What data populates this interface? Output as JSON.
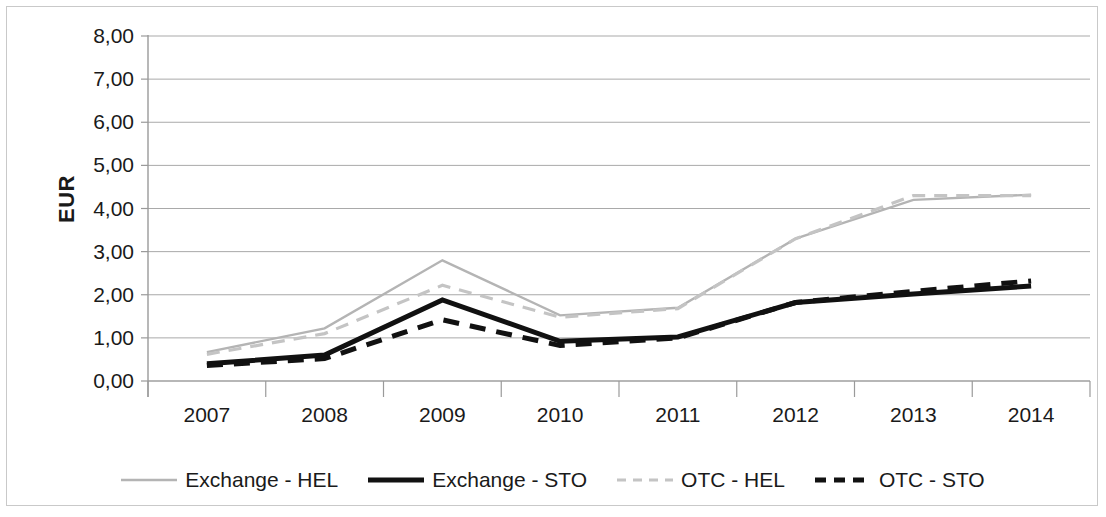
{
  "chart_data": {
    "type": "line",
    "title": "",
    "xlabel": "",
    "ylabel": "EUR",
    "categories": [
      "2007",
      "2008",
      "2009",
      "2010",
      "2011",
      "2012",
      "2013",
      "2014"
    ],
    "ylim": [
      0,
      8
    ],
    "ytick_labels": [
      "0,00",
      "1,00",
      "2,00",
      "3,00",
      "4,00",
      "5,00",
      "6,00",
      "7,00",
      "8,00"
    ],
    "ytick_values": [
      0,
      1,
      2,
      3,
      4,
      5,
      6,
      7,
      8
    ],
    "grid": true,
    "legend_position": "bottom",
    "decimal_separator": ",",
    "series": [
      {
        "name": "Exchange - HEL",
        "style": "solid",
        "color": "#b4b4b4",
        "width": 2.4,
        "values": [
          0.67,
          1.22,
          2.8,
          1.52,
          1.7,
          3.3,
          4.2,
          4.32
        ]
      },
      {
        "name": "Exchange - STO",
        "style": "solid",
        "color": "#111111",
        "width": 5,
        "values": [
          0.4,
          0.6,
          1.88,
          0.92,
          1.02,
          1.82,
          2.02,
          2.2
        ]
      },
      {
        "name": "OTC - HEL",
        "style": "dashed",
        "color": "#c4c4c4",
        "width": 3.2,
        "values": [
          0.62,
          1.1,
          2.22,
          1.48,
          1.68,
          3.3,
          4.3,
          4.3
        ]
      },
      {
        "name": "OTC - STO",
        "style": "dashed",
        "color": "#111111",
        "width": 5,
        "values": [
          0.36,
          0.52,
          1.42,
          0.82,
          1.0,
          1.82,
          2.08,
          2.32
        ]
      }
    ]
  },
  "legend": {
    "items": [
      {
        "label": "Exchange - HEL"
      },
      {
        "label": "Exchange - STO"
      },
      {
        "label": "OTC - HEL"
      },
      {
        "label": "OTC - STO"
      }
    ]
  }
}
